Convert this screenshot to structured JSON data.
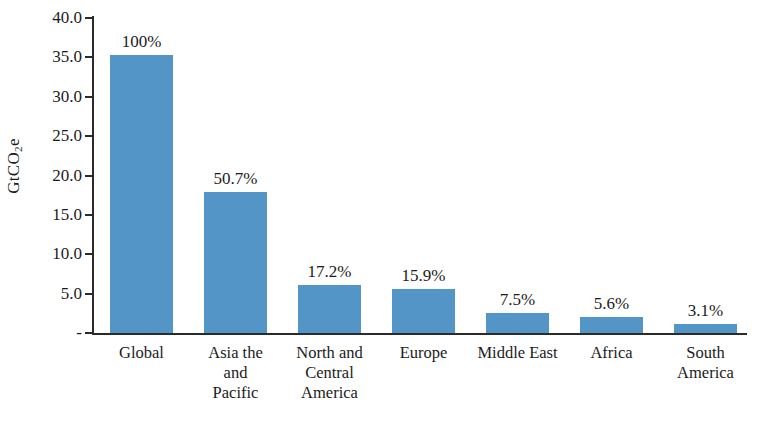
{
  "chart_data": {
    "type": "bar",
    "title": "",
    "subtitle": "",
    "xlabel": "",
    "ylabel": "GtCO2e",
    "ylabel_html": "GtCO₂e",
    "ylim": [
      0,
      40
    ],
    "grid": false,
    "legend": null,
    "bar_color": "#5395c6",
    "axis_color": "#2b2b2b",
    "categories": [
      "Global",
      "Asia the and Pacific",
      "North and Central America",
      "Europe",
      "Middle East",
      "Africa",
      "South America"
    ],
    "category_lines": [
      [
        "Global"
      ],
      [
        "Asia the",
        "and",
        "Pacific"
      ],
      [
        "North and",
        "Central",
        "America"
      ],
      [
        "Europe"
      ],
      [
        "Middle East"
      ],
      [
        "Africa"
      ],
      [
        "South",
        "America"
      ]
    ],
    "values": [
      35.3,
      17.9,
      6.1,
      5.6,
      2.6,
      2.0,
      1.1
    ],
    "data_labels": [
      "100%",
      "50.7%",
      "17.2%",
      "15.9%",
      "7.5%",
      "5.6%",
      "3.1%"
    ],
    "ytick_values": [
      40.0,
      35.0,
      30.0,
      25.0,
      20.0,
      15.0,
      10.0,
      5.0,
      0
    ],
    "ytick_labels": [
      "40.0",
      "35.0",
      "30.0",
      "25.0",
      "20.0",
      "15.0",
      "10.0",
      "5.0",
      "-"
    ]
  }
}
